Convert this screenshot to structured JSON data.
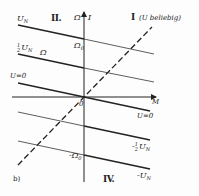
{
  "figure": {
    "panel_label": "b)",
    "axes": {
      "vertical_label_1": "Ω",
      "vertical_label_2": "I",
      "horizontal_label": "M",
      "origin_label": "0"
    },
    "quadrants": {
      "q1": "I",
      "q1_note": "(U beliebig)",
      "q2": "II.",
      "q4": "IV."
    },
    "markers": {
      "omega0": "Ω",
      "omega0_sub": "0",
      "neg_omega0": "-Ω",
      "neg_omega0_sub": "0",
      "omega_curve": "Ω"
    },
    "lines": [
      {
        "label": "U",
        "sub": "N",
        "side": "left",
        "value": "U_N"
      },
      {
        "label": "U",
        "sub": "N",
        "frac": "1/2",
        "side": "left",
        "value": "½U_N"
      },
      {
        "label": "U=0",
        "side": "left",
        "value": "0"
      },
      {
        "label": "U=0",
        "side": "right",
        "value": "0"
      },
      {
        "label": "-U",
        "sub": "N",
        "frac": "1/2",
        "side": "right",
        "value": "-½U_N"
      },
      {
        "label": "-U",
        "sub": "N",
        "side": "right",
        "value": "-U_N"
      }
    ],
    "colors": {
      "ink": "#222222",
      "background": "#fdfdfd"
    }
  }
}
